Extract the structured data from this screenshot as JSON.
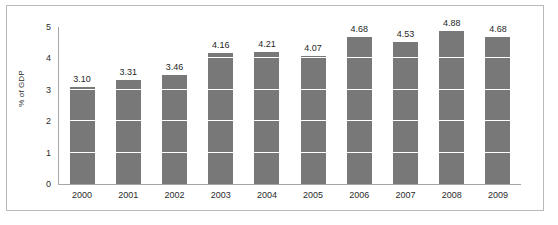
{
  "chart_data": {
    "type": "bar",
    "title": "",
    "xlabel": "",
    "ylabel": "% of GDP",
    "categories": [
      "2000",
      "2001",
      "2002",
      "2003",
      "2004",
      "2005",
      "2006",
      "2007",
      "2008",
      "2009"
    ],
    "values": [
      3.1,
      3.31,
      3.46,
      4.16,
      4.21,
      4.07,
      4.68,
      4.53,
      4.88,
      4.68
    ],
    "data_labels": [
      "3.10",
      "3.31",
      "3.46",
      "4.16",
      "4.21",
      "4.07",
      "4.68",
      "4.53",
      "4.88",
      "4.68"
    ],
    "ylim": [
      0,
      5
    ],
    "y_ticks": [
      0,
      1,
      2,
      3,
      4,
      5
    ],
    "y_tick_labels": [
      "0",
      "1",
      "2",
      "3",
      "4",
      "5"
    ],
    "grid": "horizontal-white-over-bars",
    "legend": "none",
    "series": [
      {
        "name": "% of GDP",
        "color": "#787878",
        "values": [
          3.1,
          3.31,
          3.46,
          4.16,
          4.21,
          4.07,
          4.68,
          4.53,
          4.88,
          4.68
        ]
      }
    ]
  },
  "style": {
    "bar_color": "#787878",
    "gridline_color": "#ffffff",
    "axis_color": "#a6a6a6",
    "frame_color": "#b9b9b9",
    "background": "#ffffff",
    "text_color": "#2b2b2b"
  }
}
